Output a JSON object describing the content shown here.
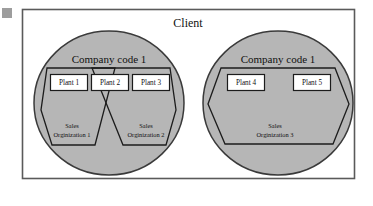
{
  "diagram": {
    "title": "Client",
    "outer_container_label": "Client",
    "colors": {
      "circle_fill": "#b6b6b6",
      "frame_stroke": "#5a5a5a",
      "shape_stroke": "#1c1c1c",
      "box_fill": "#ffffff",
      "page_background": "#ffffff"
    },
    "company_codes": [
      {
        "label": "Company code 1",
        "plants": [
          {
            "label": "Plant 1"
          },
          {
            "label": "Plant 2"
          },
          {
            "label": "Plant 3"
          }
        ],
        "sales_organizations": [
          {
            "line1": "Sales",
            "line2": "Orginization 1"
          },
          {
            "line1": "Sales",
            "line2": "Orginization 2"
          }
        ]
      },
      {
        "label": "Company code 1",
        "plants": [
          {
            "label": "Plant 4"
          },
          {
            "label": "Plant 5"
          }
        ],
        "sales_organizations": [
          {
            "line1": "Sales",
            "line2": "Orginization 3"
          }
        ]
      }
    ]
  }
}
